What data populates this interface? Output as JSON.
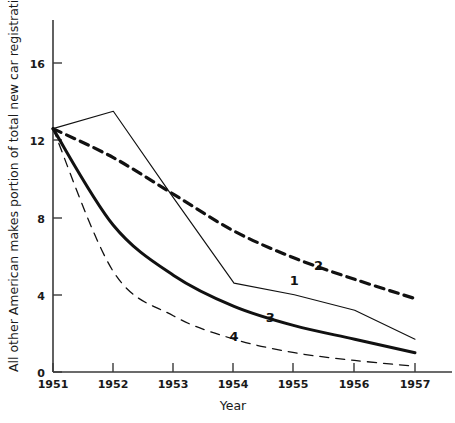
{
  "chart_data": {
    "type": "line",
    "title": "",
    "xlabel": "Year",
    "ylabel": "All other American makes portion of total new car registrations (%)",
    "x": [
      1951,
      1952,
      1953,
      1954,
      1955,
      1956,
      1957
    ],
    "xticklabels": [
      "1951",
      "1952",
      "1953",
      "1954",
      "1955",
      "1956",
      "1957"
    ],
    "yticklabels": [
      "0",
      "4",
      "8",
      "12",
      "16"
    ],
    "yticks": [
      0,
      4,
      8,
      12,
      16
    ],
    "xlim": [
      1951,
      1957
    ],
    "ylim": [
      0,
      17.6
    ],
    "grid": false,
    "legend": "inline-curve-labels",
    "series": [
      {
        "name": "1",
        "label": "1",
        "style": "thin-solid",
        "values": [
          12.6,
          13.5,
          9.0,
          4.6,
          4.0,
          3.2,
          1.7
        ]
      },
      {
        "name": "2",
        "label": "2",
        "style": "thick-dashed",
        "values": [
          12.6,
          11.1,
          9.2,
          7.3,
          5.9,
          4.8,
          3.8
        ]
      },
      {
        "name": "3",
        "label": "3",
        "style": "thick-solid",
        "values": [
          12.6,
          7.6,
          5.0,
          3.4,
          2.4,
          1.7,
          1.0
        ]
      },
      {
        "name": "4",
        "label": "4",
        "style": "thin-dashed",
        "values": [
          12.6,
          5.2,
          2.9,
          1.7,
          1.0,
          0.6,
          0.3
        ]
      }
    ],
    "annotations": [
      {
        "text": "1",
        "series": "1",
        "x": 1955.0,
        "y": 4.5
      },
      {
        "text": "2",
        "series": "2",
        "x": 1955.4,
        "y": 5.3
      },
      {
        "text": "3",
        "series": "3",
        "x": 1954.6,
        "y": 2.6
      },
      {
        "text": "4",
        "series": "4",
        "x": 1954.0,
        "y": 1.6
      }
    ],
    "colors": {
      "axis": "#3a3a3a",
      "curve": "#111111",
      "background": "#ffffff"
    }
  }
}
